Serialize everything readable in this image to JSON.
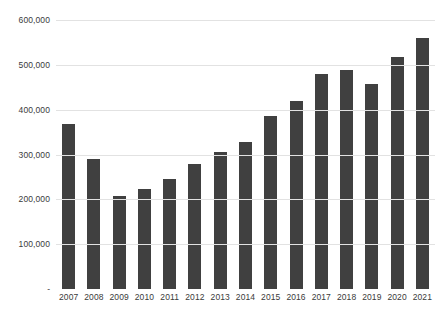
{
  "chart_data": {
    "type": "bar",
    "title": "",
    "subtitle": "",
    "xlabel": "",
    "ylabel": "",
    "categories": [
      "2007",
      "2008",
      "2009",
      "2010",
      "2011",
      "2012",
      "2013",
      "2014",
      "2015",
      "2016",
      "2017",
      "2018",
      "2019",
      "2020",
      "2021"
    ],
    "values": [
      367000,
      291000,
      207000,
      223000,
      245000,
      279000,
      305000,
      328000,
      385000,
      420000,
      480000,
      489000,
      457000,
      518000,
      559000
    ],
    "series": [
      {
        "name": "",
        "values": [
          367000,
          291000,
          207000,
          223000,
          245000,
          279000,
          305000,
          328000,
          385000,
          420000,
          480000,
          489000,
          457000,
          518000,
          559000
        ]
      }
    ],
    "ylim": [
      0,
      600000
    ],
    "ytick_values": [
      0,
      100000,
      200000,
      300000,
      400000,
      500000,
      600000
    ],
    "ytick_labels": [
      "-",
      "100,000",
      "200,000",
      "300,000",
      "400,000",
      "500,000",
      "600,000"
    ],
    "grid": true,
    "grid_axis": "y",
    "legend": false,
    "legend_position": "none",
    "bar_color": "#404040",
    "gridline_color": "#e2e2e2",
    "background_color": "#ffffff",
    "annotations": []
  }
}
